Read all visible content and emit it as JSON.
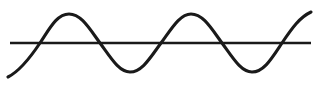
{
  "figure": {
    "title": "Sine wave intersecting a horizontal straight line",
    "background_color": "#ffffff",
    "width": 316,
    "height": 101
  },
  "chart_data": {
    "type": "line",
    "title": "Sine wave intersecting a horizontal straight line",
    "subtitle": "",
    "xlabel": "",
    "ylabel": "",
    "xlim": [
      0,
      316
    ],
    "ylim": [
      101,
      0
    ],
    "grid": false,
    "legend": null,
    "axis_visible": false,
    "tick_labels": {
      "x": [],
      "y": []
    },
    "annotations": [],
    "series": [
      {
        "name": "horizontal-line",
        "type": "line",
        "color": "#1a1a1a",
        "stroke_width": 2.4,
        "x": [
          10,
          311
        ],
        "values": [
          43,
          43
        ],
        "description": "Straight horizontal baseline crossing the full figure width"
      },
      {
        "name": "sine-wave",
        "type": "line",
        "color": "#1a1a1a",
        "stroke_width": 3.1,
        "amplitude": 29,
        "wavelength": 121,
        "midline_y": 43,
        "phase_start": "ascending from below the midline",
        "description": "Sinusoidal curve with two full crests and two full troughs, entering at lower-left and exiting at upper-right",
        "x": [
          8,
          40,
          69,
          100,
          130,
          161,
          191,
          222,
          252,
          282,
          311
        ],
        "values": [
          77,
          43,
          14,
          43,
          72,
          43,
          14,
          43,
          72,
          43,
          12
        ],
        "crossings_x": [
          40,
          100,
          161,
          222,
          282
        ],
        "crests": [
          {
            "x": 69,
            "y": 14
          },
          {
            "x": 191,
            "y": 14
          }
        ],
        "troughs": [
          {
            "x": 130,
            "y": 72
          },
          {
            "x": 252,
            "y": 72
          }
        ],
        "endpoints": [
          {
            "x": 8,
            "y": 77,
            "position": "lower-left"
          },
          {
            "x": 311,
            "y": 12,
            "position": "upper-right"
          }
        ]
      }
    ],
    "path_definitions": {
      "axis": "M 10,43 L 311,43",
      "wave": "M 8,77 C 18,72 28,61 40,43 C 50,28 57,14 69,14 C 81,14 89,28 100,43 C 111,58 119,72 130,72 C 142,72 150,58 161,43 C 172,28 180,14 191,14 C 203,14 211,28 222,43 C 233,58 241,72 252,72 C 264,72 272,58 282,43 C 292,28 300,17 311,12"
    }
  }
}
